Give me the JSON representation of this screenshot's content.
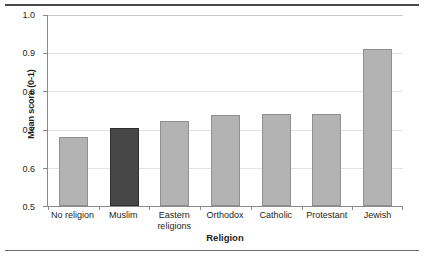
{
  "chart_data": {
    "type": "bar",
    "title": "",
    "subtitle": "",
    "xlabel": "Religion",
    "ylabel": "Mean score (0-1)",
    "categories": [
      "No religion",
      "Muslim",
      "Eastern religions",
      "Orthodox",
      "Catholic",
      "Protestant",
      "Jewish"
    ],
    "values": [
      0.68,
      0.705,
      0.723,
      0.737,
      0.741,
      0.742,
      0.91
    ],
    "ylim": [
      0.5,
      1.0
    ],
    "yticks": [
      "0.5",
      "0.6",
      "0.7",
      "0.8",
      "0.9",
      "1.0"
    ],
    "ytick_values": [
      0.5,
      0.6,
      0.7,
      0.8,
      0.9,
      1.0
    ],
    "grid": true,
    "legend": "none",
    "highlight_category": "Muslim",
    "colors": {
      "bar_fill": "#b3b3b3",
      "bar_stroke": "#8f8f8f",
      "highlight_fill": "#474747",
      "highlight_stroke": "#2e2e2e",
      "gridline": "#e3e3e3",
      "axis": "#8a8a8a",
      "text": "#231f20",
      "rule": "#4a4a4a"
    }
  },
  "axes": {
    "y_title": "Mean score (0-1)",
    "x_title": "Religion",
    "y_ticks": [
      {
        "label": "1.0",
        "value": 1.0
      },
      {
        "label": "0.9",
        "value": 0.9
      },
      {
        "label": "0.8",
        "value": 0.8
      },
      {
        "label": "0.7",
        "value": 0.7
      },
      {
        "label": "0.6",
        "value": 0.6
      },
      {
        "label": "0.5",
        "value": 0.5
      }
    ],
    "x_categories": [
      {
        "label": "No religion"
      },
      {
        "label": "Muslim"
      },
      {
        "label": "Eastern\nreligions"
      },
      {
        "label": "Orthodox"
      },
      {
        "label": "Catholic"
      },
      {
        "label": "Protestant"
      },
      {
        "label": "Jewish"
      }
    ]
  }
}
